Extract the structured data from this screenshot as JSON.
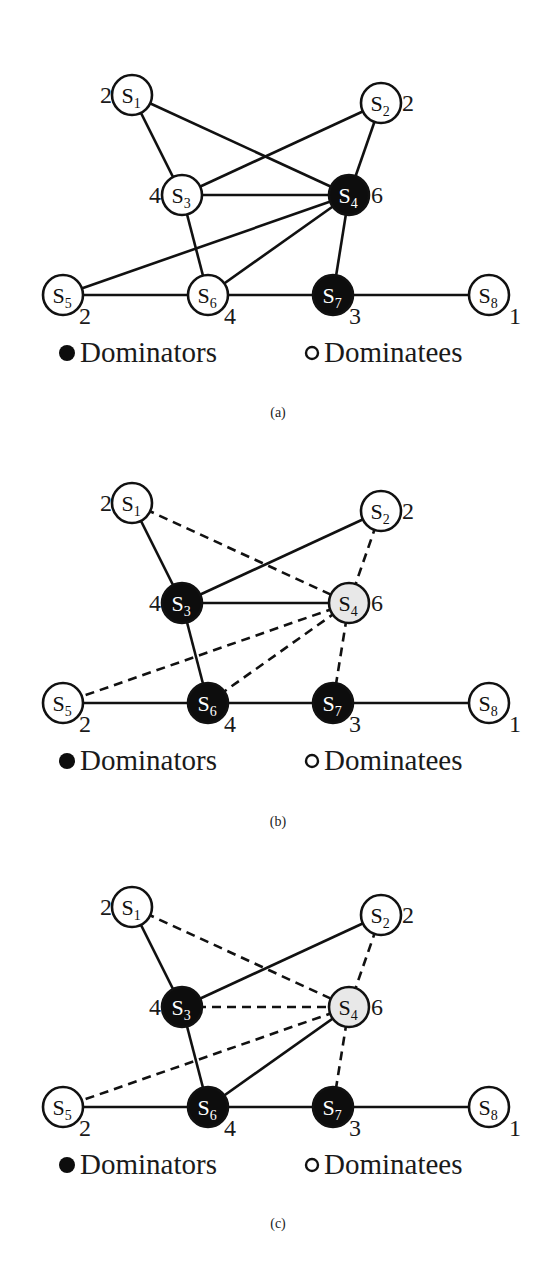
{
  "figure": {
    "node_radius": 20,
    "colors": {
      "dominator_fill": "#0d0d0d",
      "dominatee_fill": "#ffffff",
      "highlight_fill": "#e8e8e8",
      "stroke": "#111111",
      "dominator_text": "#ffffff",
      "dominatee_text": "#111111"
    },
    "nodes": [
      {
        "id": "S1",
        "base": "S",
        "sub": "1",
        "x": 132,
        "y": 95,
        "degree": "2",
        "deg_dx": -20,
        "deg_dy": 8,
        "deg_anchor": "end"
      },
      {
        "id": "S2",
        "base": "S",
        "sub": "2",
        "x": 381,
        "y": 103,
        "degree": "2",
        "deg_dx": 21,
        "deg_dy": 8,
        "deg_anchor": "start"
      },
      {
        "id": "S3",
        "base": "S",
        "sub": "3",
        "x": 182,
        "y": 195,
        "degree": "4",
        "deg_dx": -21,
        "deg_dy": 8,
        "deg_anchor": "end"
      },
      {
        "id": "S4",
        "base": "S",
        "sub": "4",
        "x": 349,
        "y": 195,
        "degree": "6",
        "deg_dx": 22,
        "deg_dy": 8,
        "deg_anchor": "start"
      },
      {
        "id": "S5",
        "base": "S",
        "sub": "5",
        "x": 63,
        "y": 295,
        "degree": "2",
        "deg_dx": 16,
        "deg_dy": 29,
        "deg_anchor": "start"
      },
      {
        "id": "S6",
        "base": "S",
        "sub": "6",
        "x": 208,
        "y": 295,
        "degree": "4",
        "deg_dx": 16,
        "deg_dy": 29,
        "deg_anchor": "start"
      },
      {
        "id": "S7",
        "base": "S",
        "sub": "7",
        "x": 333,
        "y": 295,
        "degree": "3",
        "deg_dx": 16,
        "deg_dy": 29,
        "deg_anchor": "start"
      },
      {
        "id": "S8",
        "base": "S",
        "sub": "8",
        "x": 489,
        "y": 295,
        "degree": "1",
        "deg_dx": 20,
        "deg_dy": 29,
        "deg_anchor": "start"
      }
    ],
    "legend": {
      "dominators_label": "Dominators",
      "dominatees_label": "Dominatees",
      "dominators_bullet_x": 67,
      "dominators_text_x": 80,
      "dominatees_bullet_x": 312,
      "dominatees_text_x": 324,
      "y": 362
    }
  },
  "panels": [
    {
      "caption": "(a)",
      "top": 0,
      "caption_y": 405,
      "node_states": {
        "S1": "dominatee",
        "S2": "dominatee",
        "S3": "dominatee",
        "S4": "dominator",
        "S5": "dominatee",
        "S6": "dominatee",
        "S7": "dominator",
        "S8": "dominatee"
      },
      "edges": [
        {
          "from": "S1",
          "to": "S3",
          "style": "solid"
        },
        {
          "from": "S1",
          "to": "S4",
          "style": "solid"
        },
        {
          "from": "S2",
          "to": "S3",
          "style": "solid"
        },
        {
          "from": "S2",
          "to": "S4",
          "style": "solid"
        },
        {
          "from": "S3",
          "to": "S4",
          "style": "solid"
        },
        {
          "from": "S3",
          "to": "S6",
          "style": "solid"
        },
        {
          "from": "S4",
          "to": "S5",
          "style": "solid"
        },
        {
          "from": "S4",
          "to": "S6",
          "style": "solid"
        },
        {
          "from": "S4",
          "to": "S7",
          "style": "solid"
        },
        {
          "from": "S5",
          "to": "S6",
          "style": "solid"
        },
        {
          "from": "S6",
          "to": "S7",
          "style": "solid"
        },
        {
          "from": "S7",
          "to": "S8",
          "style": "solid"
        }
      ]
    },
    {
      "caption": "(b)",
      "top": 408,
      "caption_y": 406,
      "node_states": {
        "S1": "dominatee",
        "S2": "dominatee",
        "S3": "dominator",
        "S4": "highlight",
        "S5": "dominatee",
        "S6": "dominator",
        "S7": "dominator",
        "S8": "dominatee"
      },
      "edges": [
        {
          "from": "S1",
          "to": "S3",
          "style": "solid"
        },
        {
          "from": "S1",
          "to": "S4",
          "style": "dashed"
        },
        {
          "from": "S2",
          "to": "S3",
          "style": "solid"
        },
        {
          "from": "S2",
          "to": "S4",
          "style": "dashed"
        },
        {
          "from": "S3",
          "to": "S4",
          "style": "solid"
        },
        {
          "from": "S3",
          "to": "S6",
          "style": "solid"
        },
        {
          "from": "S4",
          "to": "S5",
          "style": "dashed"
        },
        {
          "from": "S4",
          "to": "S6",
          "style": "dashed"
        },
        {
          "from": "S4",
          "to": "S7",
          "style": "dashed"
        },
        {
          "from": "S5",
          "to": "S6",
          "style": "solid"
        },
        {
          "from": "S6",
          "to": "S7",
          "style": "solid"
        },
        {
          "from": "S7",
          "to": "S8",
          "style": "solid"
        }
      ]
    },
    {
      "caption": "(c)",
      "top": 812,
      "caption_y": 404,
      "node_states": {
        "S1": "dominatee",
        "S2": "dominatee",
        "S3": "dominator",
        "S4": "highlight",
        "S5": "dominatee",
        "S6": "dominator",
        "S7": "dominator",
        "S8": "dominatee"
      },
      "edges": [
        {
          "from": "S1",
          "to": "S3",
          "style": "solid"
        },
        {
          "from": "S1",
          "to": "S4",
          "style": "dashed"
        },
        {
          "from": "S2",
          "to": "S3",
          "style": "solid"
        },
        {
          "from": "S2",
          "to": "S4",
          "style": "dashed"
        },
        {
          "from": "S3",
          "to": "S4",
          "style": "dashed"
        },
        {
          "from": "S3",
          "to": "S6",
          "style": "solid"
        },
        {
          "from": "S4",
          "to": "S5",
          "style": "dashed"
        },
        {
          "from": "S4",
          "to": "S6",
          "style": "solid"
        },
        {
          "from": "S4",
          "to": "S7",
          "style": "dashed"
        },
        {
          "from": "S5",
          "to": "S6",
          "style": "solid"
        },
        {
          "from": "S6",
          "to": "S7",
          "style": "solid"
        },
        {
          "from": "S7",
          "to": "S8",
          "style": "solid"
        }
      ]
    }
  ]
}
